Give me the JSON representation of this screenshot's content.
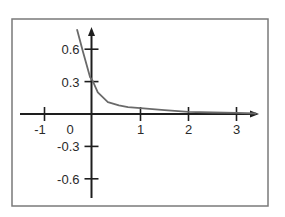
{
  "chart_data": {
    "type": "line",
    "title": "",
    "xlabel": "",
    "ylabel": "",
    "xlim": [
      -1.5,
      3.5
    ],
    "ylim": [
      -0.78,
      0.78
    ],
    "grid": false,
    "legend": null,
    "x_ticks": [
      -1,
      0,
      1,
      2,
      3
    ],
    "x_tick_labels": [
      "-1",
      "0",
      "1",
      "2",
      "3"
    ],
    "y_ticks": [
      0.6,
      0.3,
      -0.3,
      -0.6
    ],
    "y_tick_labels": [
      "0.6",
      "0.3",
      "-0.3",
      "-0.6"
    ],
    "series": [
      {
        "name": "curve",
        "color": "#6a6a6a",
        "x": [
          -0.32,
          -0.2,
          -0.05,
          0,
          0.11,
          0.32,
          0.55,
          0.74,
          1,
          1.5,
          2,
          2.5,
          3,
          3.4
        ],
        "y": [
          0.78,
          0.58,
          0.34,
          0.31,
          0.2,
          0.11,
          0.08,
          0.064,
          0.055,
          0.035,
          0.02,
          0.014,
          0.01,
          0.005
        ]
      }
    ],
    "annotations": []
  },
  "style": {
    "axis_color": "#1e1e1e",
    "frame_color": "#7a7a7a",
    "curve_color": "#6a6a6a"
  }
}
